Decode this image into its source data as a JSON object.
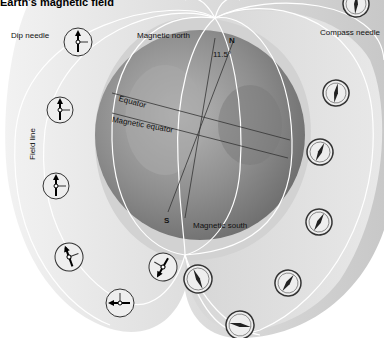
{
  "title": "Earth's magnetic field",
  "labels": {
    "dip_needle": "Dip needle",
    "magnetic_north": "Magnetic north",
    "geographic_north": "N",
    "angle": "11.5°",
    "compass_needle": "Compass needle",
    "equator": "Equator",
    "magnetic_equator": "Magnetic equator",
    "field_line": "Field line",
    "geographic_south": "S",
    "magnetic_south": "Magnetic south"
  },
  "colors": {
    "background": "#ffffff",
    "shell_outer": "#e4e4e4",
    "shell_inner": "#cfcfcf",
    "globe": "#9a9a9a",
    "field_line": "#ffffff",
    "axis_line": "#333333"
  },
  "dip_needles": [
    {
      "x": 78,
      "y": 42,
      "angle": -10
    },
    {
      "x": 60,
      "y": 110,
      "angle": -5
    },
    {
      "x": 56,
      "y": 190,
      "angle": 0
    },
    {
      "x": 68,
      "y": 252,
      "angle": 20
    },
    {
      "x": 121,
      "y": 298,
      "angle": 80
    },
    {
      "x": 163,
      "y": 268,
      "angle": 150
    }
  ],
  "compass_needles": [
    {
      "x": 356,
      "y": 4,
      "angle": 5
    },
    {
      "x": 336,
      "y": 94,
      "angle": 10
    },
    {
      "x": 319,
      "y": 150,
      "angle": 25
    },
    {
      "x": 290,
      "y": 284,
      "angle": 35
    },
    {
      "x": 319,
      "y": 224,
      "angle": 30
    },
    {
      "x": 199,
      "y": 279,
      "angle": 155
    },
    {
      "x": 239,
      "y": 325,
      "angle": 100
    }
  ]
}
